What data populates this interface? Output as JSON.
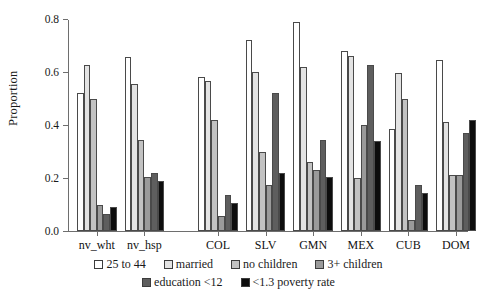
{
  "chart_data": {
    "type": "bar",
    "title": "",
    "subtitle": "",
    "xlabel": "",
    "ylabel": "Proportion",
    "ylim": [
      0,
      0.8
    ],
    "yticks": [
      "0.0",
      "0.2",
      "0.4",
      "0.6",
      "0.8"
    ],
    "ytick_values": [
      0.0,
      0.2,
      0.4,
      0.6,
      0.8
    ],
    "grid": false,
    "legend_position": "bottom",
    "categories": [
      "nv_wht",
      "nv_hsp",
      "COL",
      "SLV",
      "GMN",
      "MEX",
      "CUB",
      "DOM"
    ],
    "series": [
      {
        "name": "25 to 44",
        "color": "#ffffff",
        "values": [
          0.52,
          0.655,
          0.58,
          0.72,
          0.79,
          0.68,
          0.385,
          0.645
        ]
      },
      {
        "name": "married",
        "color": "#e3e3e3",
        "values": [
          0.625,
          0.555,
          0.565,
          0.6,
          0.62,
          0.66,
          0.595,
          0.41
        ]
      },
      {
        "name": "no children",
        "color": "#c2c2c2",
        "values": [
          0.5,
          0.345,
          0.42,
          0.3,
          0.26,
          0.2,
          0.5,
          0.21
        ]
      },
      {
        "name": "3+ children",
        "color": "#9a9a9a",
        "values": [
          0.1,
          0.205,
          0.055,
          0.175,
          0.23,
          0.4,
          0.04,
          0.21
        ]
      },
      {
        "name": "education <12",
        "color": "#5e5e5e",
        "values": [
          0.065,
          0.22,
          0.135,
          0.52,
          0.345,
          0.625,
          0.175,
          0.37
        ]
      },
      {
        "name": "<1.3 poverty rate",
        "color": "#0d0d0d",
        "values": [
          0.09,
          0.19,
          0.105,
          0.22,
          0.205,
          0.34,
          0.145,
          0.42
        ]
      }
    ],
    "legend": [
      {
        "label": "25 to 44",
        "color": "#ffffff"
      },
      {
        "label": "married",
        "color": "#e3e3e3"
      },
      {
        "label": "no children",
        "color": "#c2c2c2"
      },
      {
        "label": "3+ children",
        "color": "#9a9a9a"
      },
      {
        "label": "education <12",
        "color": "#5e5e5e"
      },
      {
        "label": "<1.3 poverty rate",
        "color": "#0d0d0d"
      }
    ],
    "legend_rows": [
      [
        "25 to 44",
        "married",
        "no children",
        "3+ children"
      ],
      [
        "education <12",
        "<1.3 poverty rate"
      ]
    ],
    "group_gap_after": [
      "nv_hsp"
    ],
    "axis_color": "#6e6e6e",
    "bar_border_color": "#4a4a4a",
    "background": "#ffffff"
  }
}
